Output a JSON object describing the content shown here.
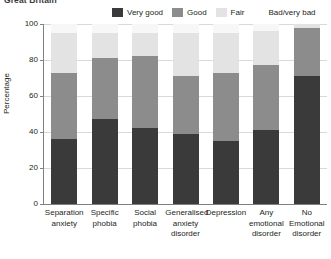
{
  "caption": "Great Britain",
  "legend": {
    "position": "top",
    "items": [
      {
        "label": "Very good",
        "color": "#3a3a3a",
        "swatch": true
      },
      {
        "label": "Good",
        "color": "#8c8c8c",
        "swatch": true
      },
      {
        "label": "Fair",
        "color": "#e3e3e3",
        "swatch": true
      },
      {
        "label": "Bad/very bad",
        "color": "#f7f7f7",
        "swatch": false
      }
    ]
  },
  "chart_data": {
    "type": "bar",
    "subtype": "stacked-100",
    "title": "Great Britain",
    "xlabel": "",
    "ylabel": "Percentage",
    "ylim": [
      0,
      100
    ],
    "yticks": [
      0,
      20,
      40,
      60,
      80,
      100
    ],
    "grid": true,
    "legend_position": "top",
    "categories": [
      "Separation anxiety",
      "Specific phobia",
      "Social phobia",
      "Generalised anxiety disorder",
      "Depression",
      "Any emotional disorder",
      "No emotional disorder"
    ],
    "series": [
      {
        "name": "Very good",
        "color": "#3a3a3a",
        "values": [
          36,
          47,
          42,
          39,
          35,
          41,
          71
        ]
      },
      {
        "name": "Good",
        "color": "#8c8c8c",
        "values": [
          37,
          34,
          40,
          32,
          38,
          36,
          27
        ]
      },
      {
        "name": "Fair",
        "color": "#e3e3e3",
        "values": [
          22,
          14,
          13,
          24,
          22,
          19,
          2
        ]
      },
      {
        "name": "Bad/very bad",
        "color": "#f7f7f7",
        "values": [
          5,
          5,
          5,
          5,
          5,
          4,
          0
        ]
      }
    ]
  },
  "xtick_labels": [
    [
      "Separation",
      "anxiety"
    ],
    [
      "Specific",
      "phobia"
    ],
    [
      "Social",
      "phobia"
    ],
    [
      "Generalised",
      "anxiety",
      "disorder"
    ],
    [
      "Depression"
    ],
    [
      "Any",
      "emotional",
      "disorder"
    ],
    [
      "No Emotional",
      "disorder"
    ]
  ]
}
